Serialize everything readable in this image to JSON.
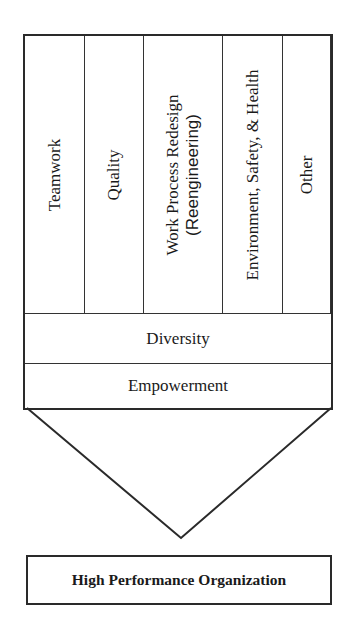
{
  "diagram": {
    "columns": [
      {
        "label": "Teamwork"
      },
      {
        "label": "Quality"
      },
      {
        "label": "Work Process Redesign",
        "sub": "(Reengineering)"
      },
      {
        "label": "Environment, Safety, & Health"
      },
      {
        "label": "Other"
      }
    ],
    "rows": [
      {
        "label": "Diversity"
      },
      {
        "label": "Empowerment"
      }
    ],
    "result": "High Performance Organization"
  }
}
